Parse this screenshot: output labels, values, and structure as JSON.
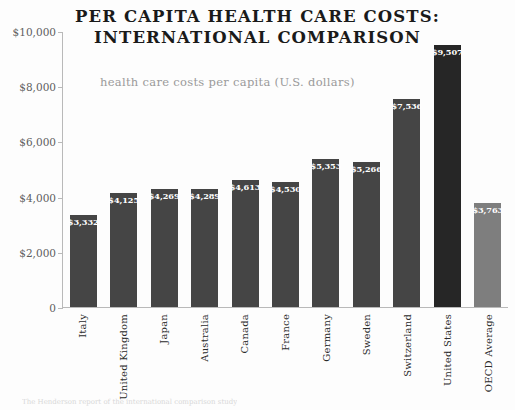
{
  "chart_data": {
    "type": "bar",
    "title": "PER CAPITA HEALTH CARE COSTS: INTERNATIONAL COMPARISON",
    "title_lines": [
      "PER CAPITA HEALTH CARE COSTS:",
      "INTERNATIONAL COMPARISON"
    ],
    "subtitle": "health care costs per capita (U.S. dollars)",
    "xlabel": "",
    "ylabel": "",
    "ylim": [
      0,
      10000
    ],
    "grid": false,
    "legend": "none",
    "ytick_values": [
      0,
      2000,
      4000,
      6000,
      8000,
      10000
    ],
    "ytick_labels": [
      "0",
      "$2,000",
      "$4,000",
      "$6,000",
      "$8,000",
      "$10,000"
    ],
    "categories": [
      "Italy",
      "United Kingdom",
      "Japan",
      "Australia",
      "Canada",
      "France",
      "Germany",
      "Sweden",
      "Switzerland",
      "United States",
      "OECD Average"
    ],
    "values": [
      3332,
      4125,
      4269,
      4289,
      4613,
      4530,
      5353,
      5266,
      7536,
      9507,
      3763
    ],
    "value_labels": [
      "$3,332",
      "$4,125",
      "$4,269",
      "$4,289",
      "$4,613",
      "$4,530",
      "$5,353",
      "$5,266",
      "$7,536",
      "$9,507",
      "$3,763"
    ],
    "bar_styles": [
      "default",
      "default",
      "default",
      "default",
      "default",
      "default",
      "default",
      "default",
      "default",
      "accent",
      "light"
    ],
    "colors": {
      "bar_default": "#454545",
      "bar_accent": "#262626",
      "bar_light": "#7e7e7e",
      "axis": "#b9b9b9",
      "title_text": "#1a1a1a",
      "subtitle_text": "#9a9a9a",
      "tick_text": "#5d5d5d",
      "value_label_text": "#ffffff",
      "background": "#fdfdfd"
    }
  },
  "footnote": "The Henderson report of the international comparison study"
}
